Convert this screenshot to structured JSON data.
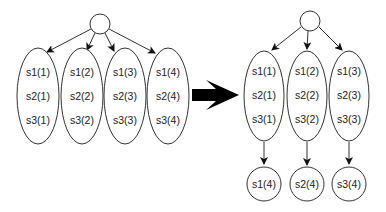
{
  "left_diagram": {
    "root": {
      "cx": 100,
      "cy": 24,
      "r": 10
    },
    "nodes": [
      {
        "cx": 38,
        "cy": 96,
        "labels": [
          "s1(1)",
          "s2(1)",
          "s3(1)"
        ]
      },
      {
        "cx": 82,
        "cy": 96,
        "labels": [
          "s1(2)",
          "s2(2)",
          "s3(2)"
        ]
      },
      {
        "cx": 125,
        "cy": 96,
        "labels": [
          "s1(3)",
          "s2(3)",
          "s3(3)"
        ]
      },
      {
        "cx": 168,
        "cy": 96,
        "labels": [
          "s1(4)",
          "s2(4)",
          "s3(4)"
        ]
      }
    ]
  },
  "transform_arrow": {
    "label": "transforms-to"
  },
  "right_diagram": {
    "root": {
      "cx": 310,
      "cy": 21,
      "r": 10
    },
    "nodes": [
      {
        "cx": 264,
        "cy": 96,
        "labels": [
          "s1(1)",
          "s2(1)",
          "s3(1)"
        ],
        "child": "s1(4)"
      },
      {
        "cx": 307,
        "cy": 96,
        "labels": [
          "s1(2)",
          "s2(2)",
          "s3(2)"
        ],
        "child": "s2(4)"
      },
      {
        "cx": 349,
        "cy": 96,
        "labels": [
          "s1(3)",
          "s2(3)",
          "s3(3)"
        ],
        "child": "s3(4)"
      }
    ]
  },
  "colors": {
    "stroke": "#333333",
    "arrow": "#000000",
    "text": "#222222"
  }
}
